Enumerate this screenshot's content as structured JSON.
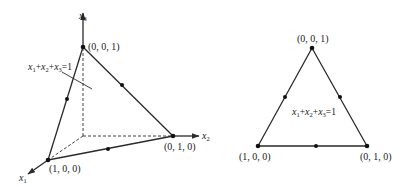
{
  "left_diagram": {
    "axes": {
      "x1": {
        "name": "x",
        "sub": "1"
      },
      "x2": {
        "name": "x",
        "sub": "2"
      },
      "x3": {
        "name": "x",
        "sub": "3"
      }
    },
    "vertices": {
      "top": "(0, 0, 1)",
      "right": "(0, 1, 0)",
      "left": "(1, 0, 0)"
    },
    "plane_label": {
      "parts": [
        {
          "v": "x",
          "s": "1"
        },
        {
          "op": "+"
        },
        {
          "v": "x",
          "s": "2"
        },
        {
          "op": "+"
        },
        {
          "v": "x",
          "s": "3"
        },
        {
          "op": "=1"
        }
      ]
    }
  },
  "right_diagram": {
    "vertices": {
      "top": "(0, 0, 1)",
      "left": "(1, 0, 0)",
      "right": "(0, 1, 0)"
    },
    "plane_label": {
      "parts": [
        {
          "v": "x",
          "s": "1"
        },
        {
          "op": "+"
        },
        {
          "v": "x",
          "s": "2"
        },
        {
          "op": "+"
        },
        {
          "v": "x",
          "s": "3"
        },
        {
          "op": "=1"
        }
      ]
    }
  },
  "colors": {
    "line": "#2a2a2a",
    "dot": "#111111",
    "text": "#222222"
  }
}
